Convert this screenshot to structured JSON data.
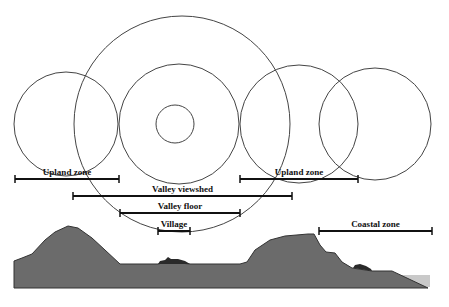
{
  "diagram": {
    "colors": {
      "circle_stroke": "#444444",
      "bar": "#111111",
      "terrain": "#6b6b6b",
      "terrain_edge": "#333333",
      "sea": "#c9c9c9",
      "settlement": "#2a2a2a"
    },
    "circles": [
      {
        "name": "upland-left-circle",
        "cx": 66,
        "cy": 124,
        "r": 52
      },
      {
        "name": "valley-viewshed-circle",
        "cx": 182,
        "cy": 124,
        "r": 108
      },
      {
        "name": "valley-floor-circle",
        "cx": 179,
        "cy": 124,
        "r": 60
      },
      {
        "name": "village-circle",
        "cx": 175,
        "cy": 124,
        "r": 19
      },
      {
        "name": "upland-right-circle",
        "cx": 299,
        "cy": 124,
        "r": 59
      },
      {
        "name": "coastal-circle",
        "cx": 375,
        "cy": 124,
        "r": 56
      }
    ],
    "bars": [
      {
        "name": "upland-zone-left",
        "label": "Upland zone",
        "x1": 15,
        "x2": 119,
        "y": 179
      },
      {
        "name": "valley-viewshed",
        "label": "Valley viewshed",
        "x1": 73,
        "x2": 292,
        "y": 196
      },
      {
        "name": "valley-floor",
        "label": "Valley floor",
        "x1": 120,
        "x2": 240,
        "y": 213
      },
      {
        "name": "village",
        "label": "Village",
        "x1": 158,
        "x2": 190,
        "y": 231
      },
      {
        "name": "upland-zone-right",
        "label": "Upland zone",
        "x1": 240,
        "x2": 358,
        "y": 179
      },
      {
        "name": "coastal-zone",
        "label": "Coastal zone",
        "x1": 319,
        "x2": 432,
        "y": 231
      }
    ]
  }
}
